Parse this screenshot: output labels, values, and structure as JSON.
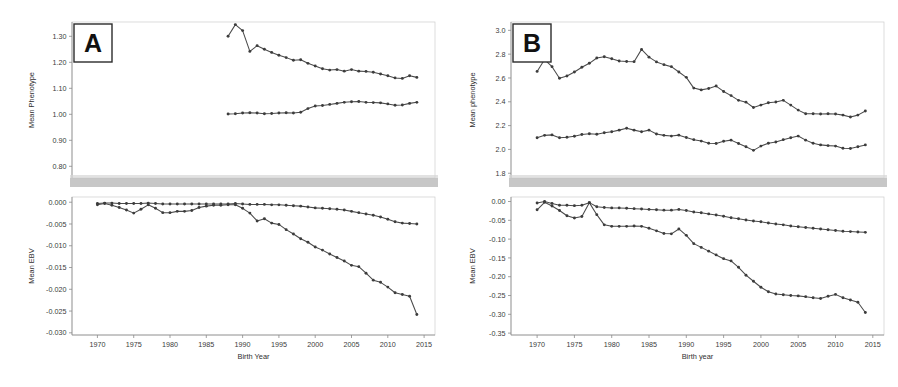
{
  "figure": {
    "title": "",
    "panels": [
      "A",
      "B"
    ],
    "background": "#ffffff",
    "line_color": "#4a4a4a",
    "marker_color": "#3c3c3c"
  },
  "panel_a": {
    "tag": "A",
    "top": {
      "ylabel": "Mean Phenotype",
      "yticks": [
        "1.30",
        "1.20",
        "1.10",
        "1.00",
        "0.90",
        "0.80"
      ]
    },
    "bottom": {
      "ylabel": "Mean EBV",
      "yticks": [
        "0.000",
        "-0.005",
        "-0.010",
        "-0.015",
        "-0.020",
        "-0.025",
        "-0.030"
      ],
      "xlabel": "Birth Year",
      "xticks": [
        "1970",
        "1975",
        "1980",
        "1985",
        "1990",
        "1995",
        "2000",
        "2005",
        "2010",
        "2015"
      ]
    }
  },
  "panel_b": {
    "tag": "B",
    "top": {
      "ylabel": "Mean phenotype",
      "yticks": [
        "3.0",
        "2.8",
        "2.6",
        "2.4",
        "2.2",
        "2.0",
        "1.8"
      ]
    },
    "bottom": {
      "ylabel": "Mean EBV",
      "yticks": [
        "0.00",
        "-0.05",
        "-0.10",
        "-0.15",
        "-0.20",
        "-0.25",
        "-0.30",
        "-0.35"
      ],
      "xlabel": "Birth year",
      "xticks": [
        "1970",
        "1975",
        "1980",
        "1985",
        "1990",
        "1995",
        "2000",
        "2005",
        "2010",
        "2015"
      ]
    }
  },
  "chart_data": [
    {
      "id": "panel-a-phenotype",
      "type": "line",
      "title": "A - Mean Phenotype by Birth Year",
      "xlabel": "Birth Year",
      "ylabel": "Mean Phenotype",
      "xlim": [
        1966.5,
        2016.5
      ],
      "ylim": [
        0.755,
        1.355
      ],
      "yticks": [
        1.3,
        1.2,
        1.1,
        1.0,
        0.9,
        0.8
      ],
      "xticks": [
        1970,
        1975,
        1980,
        1985,
        1990,
        1995,
        2000,
        2005,
        2010,
        2015
      ],
      "grid": false,
      "legend": "none",
      "series": [
        {
          "name": "upper-phenotype-series",
          "x": [
            1988,
            1989,
            1990,
            1991,
            1992,
            1993,
            1994,
            1995,
            1996,
            1997,
            1998,
            1999,
            2000,
            2001,
            2002,
            2003,
            2004,
            2005,
            2006,
            2007,
            2008,
            2009,
            2010,
            2011,
            2012,
            2013,
            2014
          ],
          "y": [
            1.3,
            1.345,
            1.322,
            1.242,
            1.264,
            1.25,
            1.238,
            1.227,
            1.218,
            1.208,
            1.21,
            1.196,
            1.186,
            1.175,
            1.17,
            1.172,
            1.166,
            1.172,
            1.166,
            1.165,
            1.162,
            1.155,
            1.148,
            1.14,
            1.138,
            1.148,
            1.142
          ]
        },
        {
          "name": "lower-phenotype-series",
          "x": [
            1988,
            1989,
            1990,
            1991,
            1992,
            1993,
            1994,
            1995,
            1996,
            1997,
            1998,
            1999,
            2000,
            2001,
            2002,
            2003,
            2004,
            2005,
            2006,
            2007,
            2008,
            2009,
            2010,
            2011,
            2012,
            2013,
            2014
          ],
          "y": [
            1.001,
            1.002,
            1.005,
            1.006,
            1.005,
            1.002,
            1.003,
            1.005,
            1.006,
            1.005,
            1.008,
            1.022,
            1.032,
            1.034,
            1.038,
            1.042,
            1.046,
            1.048,
            1.049,
            1.046,
            1.045,
            1.044,
            1.04,
            1.035,
            1.036,
            1.042,
            1.046
          ]
        }
      ]
    },
    {
      "id": "panel-a-ebv",
      "type": "line",
      "title": "A - Mean EBV by Birth Year",
      "xlabel": "Birth Year",
      "ylabel": "Mean EBV",
      "xlim": [
        1966.5,
        2016.5
      ],
      "ylim": [
        -0.0305,
        0.0012
      ],
      "yticks": [
        0.0,
        -0.005,
        -0.01,
        -0.015,
        -0.02,
        -0.025,
        -0.03
      ],
      "xticks": [
        1970,
        1975,
        1980,
        1985,
        1990,
        1995,
        2000,
        2005,
        2010,
        2015
      ],
      "grid": false,
      "legend": "none",
      "series": [
        {
          "name": "upper-ebv-series",
          "x": [
            1970,
            1971,
            1972,
            1973,
            1974,
            1975,
            1976,
            1977,
            1978,
            1979,
            1980,
            1981,
            1982,
            1983,
            1984,
            1985,
            1986,
            1987,
            1988,
            1989,
            1990,
            1991,
            1992,
            1993,
            1994,
            1995,
            1996,
            1997,
            1998,
            1999,
            2000,
            2001,
            2002,
            2003,
            2004,
            2005,
            2006,
            2007,
            2008,
            2009,
            2010,
            2011,
            2012,
            2013,
            2014
          ],
          "y": [
            -0.0003,
            -0.0002,
            -0.0002,
            -0.0003,
            -0.0003,
            -0.0003,
            -0.0003,
            -0.0002,
            -0.0003,
            -0.0004,
            -0.0004,
            -0.0004,
            -0.0004,
            -0.0004,
            -0.0004,
            -0.0004,
            -0.0004,
            -0.0004,
            -0.0004,
            -0.0003,
            -0.0004,
            -0.0005,
            -0.0005,
            -0.0005,
            -0.0006,
            -0.0006,
            -0.0007,
            -0.0008,
            -0.0009,
            -0.0011,
            -0.0013,
            -0.0014,
            -0.0015,
            -0.0016,
            -0.0018,
            -0.0021,
            -0.0024,
            -0.0027,
            -0.003,
            -0.0034,
            -0.0039,
            -0.0045,
            -0.0048,
            -0.0049,
            -0.005
          ]
        },
        {
          "name": "lower-ebv-series",
          "x": [
            1970,
            1971,
            1972,
            1973,
            1974,
            1975,
            1976,
            1977,
            1978,
            1979,
            1980,
            1981,
            1982,
            1983,
            1984,
            1985,
            1986,
            1987,
            1988,
            1989,
            1990,
            1991,
            1992,
            1993,
            1994,
            1995,
            1996,
            1997,
            1998,
            1999,
            2000,
            2001,
            2002,
            2003,
            2004,
            2005,
            2006,
            2007,
            2008,
            2009,
            2010,
            2011,
            2012,
            2013,
            2014
          ],
          "y": [
            -0.0006,
            -0.0003,
            -0.0007,
            -0.0012,
            -0.0018,
            -0.0025,
            -0.0016,
            -0.0006,
            -0.0014,
            -0.0024,
            -0.0024,
            -0.0021,
            -0.0021,
            -0.0019,
            -0.0012,
            -0.0009,
            -0.0007,
            -0.0007,
            -0.0006,
            -0.0006,
            -0.0014,
            -0.0025,
            -0.0043,
            -0.0038,
            -0.0048,
            -0.0051,
            -0.0063,
            -0.0073,
            -0.0084,
            -0.0092,
            -0.0103,
            -0.011,
            -0.0119,
            -0.0127,
            -0.0135,
            -0.0145,
            -0.0148,
            -0.0163,
            -0.0179,
            -0.0184,
            -0.0195,
            -0.0208,
            -0.0212,
            -0.0216,
            -0.0258
          ]
        }
      ]
    },
    {
      "id": "panel-b-phenotype",
      "type": "line",
      "title": "B - Mean phenotype by Birth year",
      "xlabel": "Birth year",
      "ylabel": "Mean phenotype",
      "xlim": [
        1966.5,
        2016.5
      ],
      "ylim": [
        1.76,
        3.07
      ],
      "yticks": [
        3.0,
        2.8,
        2.6,
        2.4,
        2.2,
        2.0,
        1.8
      ],
      "xticks": [
        1970,
        1975,
        1980,
        1985,
        1990,
        1995,
        2000,
        2005,
        2010,
        2015
      ],
      "grid": false,
      "legend": "none",
      "series": [
        {
          "name": "upper-phenotype-series",
          "x": [
            1970,
            1971,
            1972,
            1973,
            1974,
            1975,
            1976,
            1977,
            1978,
            1979,
            1980,
            1981,
            1982,
            1983,
            1984,
            1985,
            1986,
            1987,
            1988,
            1989,
            1990,
            1991,
            1992,
            1993,
            1994,
            1995,
            1996,
            1997,
            1998,
            1999,
            2000,
            2001,
            2002,
            2003,
            2004,
            2005,
            2006,
            2007,
            2008,
            2009,
            2010,
            2011,
            2012,
            2013,
            2014
          ],
          "y": [
            2.655,
            2.755,
            2.695,
            2.598,
            2.617,
            2.65,
            2.69,
            2.723,
            2.768,
            2.778,
            2.762,
            2.742,
            2.738,
            2.737,
            2.84,
            2.775,
            2.735,
            2.712,
            2.695,
            2.65,
            2.605,
            2.515,
            2.5,
            2.512,
            2.532,
            2.487,
            2.452,
            2.412,
            2.397,
            2.352,
            2.372,
            2.392,
            2.398,
            2.412,
            2.372,
            2.33,
            2.3,
            2.3,
            2.298,
            2.3,
            2.297,
            2.288,
            2.272,
            2.288,
            2.322
          ]
        },
        {
          "name": "lower-phenotype-series",
          "x": [
            1970,
            1971,
            1972,
            1973,
            1974,
            1975,
            1976,
            1977,
            1978,
            1979,
            1980,
            1981,
            1982,
            1983,
            1984,
            1985,
            1986,
            1987,
            1988,
            1989,
            1990,
            1991,
            1992,
            1993,
            1994,
            1995,
            1996,
            1997,
            1998,
            1999,
            2000,
            2001,
            2002,
            2003,
            2004,
            2005,
            2006,
            2007,
            2008,
            2009,
            2010,
            2011,
            2012,
            2013,
            2014
          ],
          "y": [
            2.098,
            2.118,
            2.122,
            2.098,
            2.102,
            2.11,
            2.125,
            2.132,
            2.128,
            2.14,
            2.148,
            2.162,
            2.178,
            2.162,
            2.148,
            2.162,
            2.13,
            2.118,
            2.112,
            2.12,
            2.1,
            2.082,
            2.07,
            2.052,
            2.05,
            2.068,
            2.078,
            2.05,
            2.022,
            1.992,
            2.028,
            2.052,
            2.062,
            2.082,
            2.098,
            2.112,
            2.078,
            2.052,
            2.038,
            2.032,
            2.028,
            2.01,
            2.008,
            2.022,
            2.038
          ]
        }
      ]
    },
    {
      "id": "panel-b-ebv",
      "type": "line",
      "title": "B - Mean EBV by Birth year",
      "xlabel": "Birth year",
      "ylabel": "Mean EBV",
      "xlim": [
        1966.5,
        2016.5
      ],
      "ylim": [
        -0.355,
        0.012
      ],
      "yticks": [
        0.0,
        -0.05,
        -0.1,
        -0.15,
        -0.2,
        -0.25,
        -0.3,
        -0.35
      ],
      "xticks": [
        1970,
        1975,
        1980,
        1985,
        1990,
        1995,
        2000,
        2005,
        2010,
        2015
      ],
      "grid": false,
      "legend": "none",
      "series": [
        {
          "name": "upper-ebv-series",
          "x": [
            1970,
            1971,
            1972,
            1973,
            1974,
            1975,
            1976,
            1977,
            1978,
            1979,
            1980,
            1981,
            1982,
            1983,
            1984,
            1985,
            1986,
            1987,
            1988,
            1989,
            1990,
            1991,
            1992,
            1993,
            1994,
            1995,
            1996,
            1997,
            1998,
            1999,
            2000,
            2001,
            2002,
            2003,
            2004,
            2005,
            2006,
            2007,
            2008,
            2009,
            2010,
            2011,
            2012,
            2013,
            2014
          ],
          "y": [
            -0.004,
            0.0,
            -0.005,
            -0.01,
            -0.01,
            -0.011,
            -0.01,
            -0.003,
            -0.014,
            -0.016,
            -0.017,
            -0.017,
            -0.018,
            -0.019,
            -0.02,
            -0.021,
            -0.022,
            -0.023,
            -0.023,
            -0.021,
            -0.024,
            -0.028,
            -0.03,
            -0.033,
            -0.036,
            -0.039,
            -0.043,
            -0.046,
            -0.049,
            -0.052,
            -0.054,
            -0.057,
            -0.06,
            -0.062,
            -0.065,
            -0.067,
            -0.069,
            -0.071,
            -0.073,
            -0.075,
            -0.077,
            -0.079,
            -0.08,
            -0.081,
            -0.082
          ]
        },
        {
          "name": "lower-ebv-series",
          "x": [
            1970,
            1971,
            1972,
            1973,
            1974,
            1975,
            1976,
            1977,
            1978,
            1979,
            1980,
            1981,
            1982,
            1983,
            1984,
            1985,
            1986,
            1987,
            1988,
            1989,
            1990,
            1991,
            1992,
            1993,
            1994,
            1995,
            1996,
            1997,
            1998,
            1999,
            2000,
            2001,
            2002,
            2003,
            2004,
            2005,
            2006,
            2007,
            2008,
            2009,
            2010,
            2011,
            2012,
            2013,
            2014
          ],
          "y": [
            -0.022,
            -0.002,
            -0.012,
            -0.024,
            -0.038,
            -0.044,
            -0.04,
            -0.003,
            -0.035,
            -0.062,
            -0.066,
            -0.066,
            -0.066,
            -0.065,
            -0.066,
            -0.071,
            -0.078,
            -0.085,
            -0.086,
            -0.073,
            -0.09,
            -0.112,
            -0.122,
            -0.132,
            -0.142,
            -0.152,
            -0.158,
            -0.175,
            -0.196,
            -0.212,
            -0.228,
            -0.24,
            -0.246,
            -0.248,
            -0.25,
            -0.251,
            -0.253,
            -0.256,
            -0.258,
            -0.252,
            -0.247,
            -0.256,
            -0.262,
            -0.268,
            -0.295
          ]
        }
      ]
    }
  ]
}
